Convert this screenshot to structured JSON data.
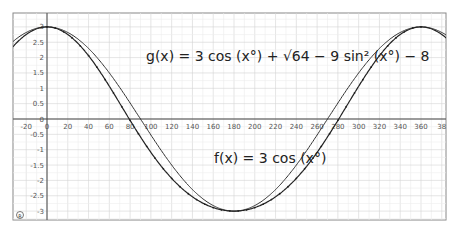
{
  "chart_data": {
    "type": "line",
    "title": "",
    "xlabel": "",
    "ylabel": "",
    "xlim": [
      -32,
      385
    ],
    "ylim": [
      -3.3,
      3.45
    ],
    "x_ticks": [
      -20,
      0,
      20,
      40,
      60,
      80,
      100,
      120,
      140,
      160,
      180,
      200,
      220,
      240,
      260,
      280,
      300,
      320,
      340,
      360,
      380
    ],
    "x_tick_labels": [
      "-20",
      "0",
      "20",
      "40",
      "60",
      "80",
      "100",
      "120",
      "140",
      "160",
      "180",
      "200",
      "220",
      "240",
      "260",
      "280",
      "300",
      "320",
      "340",
      "360",
      "38"
    ],
    "y_ticks": [
      -3,
      -2.5,
      -2,
      -1.5,
      -1,
      -0.5,
      0,
      0.5,
      1,
      1.5,
      2,
      2.5,
      3
    ],
    "y_tick_labels": [
      "-3",
      "-2.5",
      "-2",
      "-1.5",
      "-1",
      "-0.5",
      "0",
      "0.5",
      "1",
      "1.5",
      "2",
      "2.5",
      "3"
    ],
    "grid": true,
    "series": [
      {
        "name": "f(x) = 3 cos(x°)",
        "formula": "3*cos(x deg)",
        "x": [
          0,
          90,
          180,
          270,
          360
        ],
        "values": [
          3,
          0,
          -3,
          0,
          3
        ]
      },
      {
        "name": "g(x) = 3 cos(x°) + sqrt(64 - 9 sin²(x°)) - 8",
        "formula": "3*cos(x deg)+sqrt(64-9*sin(x deg)^2)-8",
        "x": [
          0,
          90,
          180,
          270,
          360
        ],
        "values": [
          3,
          -0.58,
          -3,
          -0.58,
          3
        ]
      }
    ],
    "annotations": [
      "g(x) = 3 cos(x°) + √(64 − 9 sin²(x°)) − 8",
      "f(x) = 3 cos(x°)"
    ]
  },
  "labels": {
    "g_eq": "g(x)  =  3  cos (x°) + √64 − 9  sin² (x°) − 8",
    "f_eq": "f(x)  =  3  cos (x°)",
    "corner_icon": "®"
  }
}
